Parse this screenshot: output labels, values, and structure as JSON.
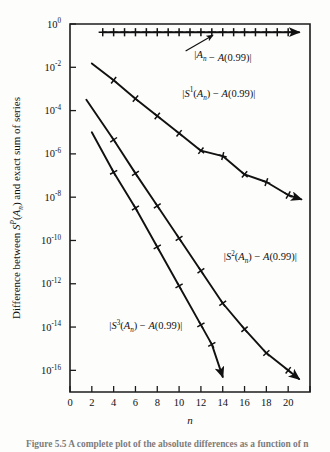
{
  "figure": {
    "background_color": "#fdfdfc",
    "ink_color": "#111111",
    "caption_fragment": "Figure 5.5  A complete plot of the absolute differences as a function of n"
  },
  "chart_data": {
    "type": "line",
    "title": "",
    "xlabel": "n",
    "ylabel": "Difference between S^P(A_n) and exact sum of series",
    "xlabel_parts": {
      "variable": "n"
    },
    "ylabel_parts": {
      "lead": "Difference between ",
      "s": "S",
      "sup": "P",
      "paren_open": "(",
      "a": "A",
      "sub": "n",
      "paren_close": ")",
      "tail": " and exact sum of series"
    },
    "xlim": [
      0,
      22
    ],
    "ylim_exp": [
      -17,
      0
    ],
    "grid": false,
    "legend_position": "inline-annotations",
    "x_ticks": [
      0,
      2,
      4,
      6,
      8,
      10,
      12,
      14,
      16,
      18,
      20
    ],
    "x_tick_labels": [
      "0",
      "2",
      "4",
      "6",
      "8",
      "10",
      "12",
      "14",
      "16",
      "18",
      "20"
    ],
    "x_minor_ticks": [
      22
    ],
    "y_ticks_exp": [
      0,
      -2,
      -4,
      -6,
      -8,
      -10,
      -12,
      -14,
      -16
    ],
    "y_tick_labels": [
      {
        "mantissa": "10",
        "exp": "0"
      },
      {
        "mantissa": "10",
        "exp": "-2"
      },
      {
        "mantissa": "10",
        "exp": "-4"
      },
      {
        "mantissa": "10",
        "exp": "-6"
      },
      {
        "mantissa": "10",
        "exp": "-8"
      },
      {
        "mantissa": "10",
        "exp": "-10"
      },
      {
        "mantissa": "10",
        "exp": "-12"
      },
      {
        "mantissa": "10",
        "exp": "-14"
      },
      {
        "mantissa": "10",
        "exp": "-16"
      }
    ],
    "series": [
      {
        "name": "|A_n - A(0.99)|",
        "label_parts": {
          "bar1": "|",
          "a": "A",
          "sub": "n",
          "minus": " − ",
          "a2": "A",
          "arg": "(0.99)",
          "bar2": "|"
        },
        "marker": "plus",
        "arrow_end": true,
        "x": [
          3,
          4,
          5,
          6,
          7,
          8,
          9,
          10,
          11,
          12,
          13,
          14,
          15,
          16,
          17,
          18,
          19,
          20,
          21
        ],
        "y_exp": [
          -0.38,
          -0.38,
          -0.38,
          -0.38,
          -0.38,
          -0.38,
          -0.38,
          -0.38,
          -0.38,
          -0.38,
          -0.38,
          -0.38,
          -0.38,
          -0.38,
          -0.38,
          -0.38,
          -0.38,
          -0.38,
          -0.38
        ],
        "marker_x": [
          3,
          4,
          5,
          6,
          7,
          8,
          9,
          10,
          11,
          12,
          13,
          14,
          15,
          16,
          17,
          18,
          19,
          20
        ],
        "label_x": 11.4,
        "label_y_exp": -1.55,
        "annot_from": [
          10.6,
          -1.25
        ],
        "annot_to": [
          13.1,
          -0.52
        ]
      },
      {
        "name": "|S^1(A_n) - A(0.99)|",
        "label_parts": {
          "bar1": "|",
          "s": "S",
          "sup": "1",
          "paren": "(",
          "a": "A",
          "sub": "n",
          "paren2": ") ",
          "minus": "− ",
          "a2": "A",
          "arg": "(0.99)",
          "bar2": "|"
        },
        "marker": "plus",
        "arrow_end": true,
        "x": [
          2,
          4,
          6,
          8,
          10,
          12,
          14,
          16,
          18,
          20,
          21.2
        ],
        "y_exp": [
          -1.82,
          -2.6,
          -3.45,
          -4.25,
          -5.05,
          -5.85,
          -6.1,
          -6.95,
          -7.3,
          -7.9,
          -8.1
        ],
        "marker_x": [
          4,
          6,
          8,
          10,
          12,
          14,
          16,
          18,
          20
        ],
        "label_x": 10.3,
        "label_y_exp": -3.35,
        "annot_from": null,
        "annot_to": null
      },
      {
        "name": "|S^2(A_n) - A(0.99)|",
        "label_parts": {
          "bar1": "|",
          "s": "S",
          "sup": "2",
          "paren": "(",
          "a": "A",
          "sub": "n",
          "paren2": ") ",
          "minus": "− ",
          "a2": "A",
          "arg": "(0.99)",
          "bar2": "|"
        },
        "marker": "plus",
        "arrow_end": true,
        "x": [
          1.5,
          4,
          6,
          8,
          10,
          12,
          14,
          16,
          18,
          20,
          21
        ],
        "y_exp": [
          -3.5,
          -5.35,
          -6.9,
          -8.4,
          -9.9,
          -11.4,
          -12.9,
          -14.1,
          -15.2,
          -16.0,
          -16.4
        ],
        "marker_x": [
          4,
          6,
          8,
          10,
          12,
          14,
          16,
          18,
          20
        ],
        "label_x": 14.1,
        "label_y_exp": -10.9,
        "annot_from": null,
        "annot_to": null
      },
      {
        "name": "|S^3(A_n) - A(0.99)|",
        "label_parts": {
          "bar1": "|",
          "s": "S",
          "sup": "3",
          "paren": "(",
          "a": "A",
          "sub": "n",
          "paren2": ") ",
          "minus": "− ",
          "a2": "A",
          "arg": "(0.99)",
          "bar2": "|"
        },
        "marker": "plus",
        "arrow_end": true,
        "x": [
          2,
          4,
          6,
          8,
          10,
          12,
          13,
          14
        ],
        "y_exp": [
          -5.0,
          -6.85,
          -8.5,
          -10.3,
          -12.1,
          -13.9,
          -14.8,
          -16.3
        ],
        "marker_x": [
          4,
          6,
          8,
          10,
          12,
          13
        ],
        "label_x": 3.6,
        "label_y_exp": -14.1,
        "annot_from": null,
        "annot_to": null
      }
    ]
  }
}
